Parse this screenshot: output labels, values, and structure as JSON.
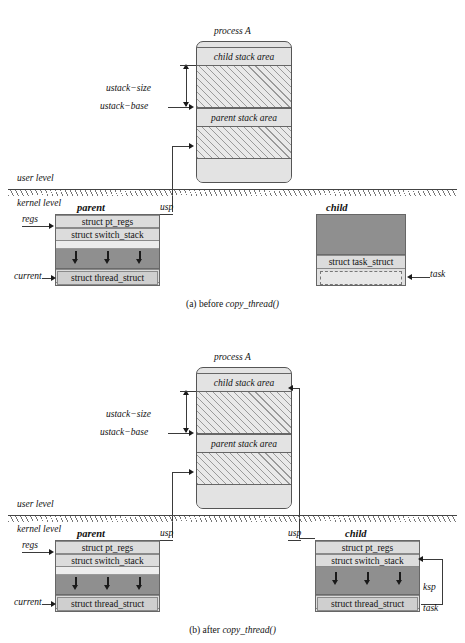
{
  "figures": [
    {
      "id": "figure-a",
      "caption_prefix": "(a) before ",
      "caption_func": "copy_thread()",
      "process_title": "process A",
      "segments": [
        {
          "label": "child stack area"
        },
        {
          "label": ""
        },
        {
          "label": "parent stack area"
        },
        {
          "label": ""
        },
        {
          "label": ""
        }
      ],
      "dim_labels": {
        "size": "ustack−size",
        "base": "ustack−base"
      },
      "level_labels": {
        "user": "user level",
        "kernel": "kernel level"
      },
      "parent": {
        "title": "parent",
        "rows": [
          "struct pt_regs",
          "struct switch_stack",
          "",
          "",
          "struct task_struct",
          "struct thread_struct"
        ],
        "pointers": {
          "regs": "regs",
          "usp": "usp",
          "current": "current"
        }
      },
      "child": {
        "title": "child",
        "rows": [
          "",
          "struct task_struct",
          ""
        ],
        "pointers": {
          "task": "task"
        }
      }
    },
    {
      "id": "figure-b",
      "caption_prefix": "(b) after ",
      "caption_func": "copy_thread()",
      "process_title": "process A",
      "segments": [
        {
          "label": "child stack area"
        },
        {
          "label": ""
        },
        {
          "label": "parent stack area"
        },
        {
          "label": ""
        },
        {
          "label": ""
        }
      ],
      "dim_labels": {
        "size": "ustack−size",
        "base": "ustack−base"
      },
      "level_labels": {
        "user": "user level",
        "kernel": "kernel level"
      },
      "parent": {
        "title": "parent",
        "rows": [
          "struct pt_regs",
          "struct switch_stack",
          "",
          "",
          "struct task_struct",
          "struct thread_struct"
        ],
        "pointers": {
          "regs": "regs",
          "usp": "usp",
          "current": "current"
        }
      },
      "child": {
        "title": "child",
        "rows": [
          "struct pt_regs",
          "struct switch_stack",
          "",
          "struct task_struct",
          "struct thread_struct"
        ],
        "pointers": {
          "usp": "usp",
          "ksp": "ksp",
          "task": "task"
        }
      }
    }
  ]
}
